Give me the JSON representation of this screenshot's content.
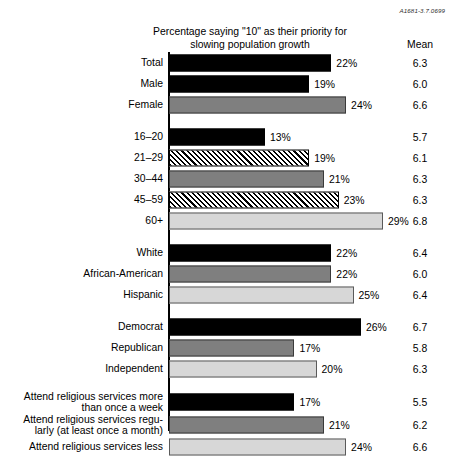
{
  "refcode": "A1681-3.7.0699",
  "title": {
    "line1": "Percentage saying \"10\" as their priority for",
    "line2": "slowing population growth"
  },
  "mean_header": "Mean",
  "chart_data": {
    "type": "bar",
    "orientation": "horizontal",
    "title": "Percentage saying \"10\" as their priority for slowing population growth",
    "xlabel": "",
    "ylabel": "",
    "xlim": [
      0,
      30
    ],
    "grid": false,
    "legend": false,
    "value_suffix": "%",
    "extra_column": {
      "header": "Mean",
      "values": [
        6.3,
        6.0,
        6.6,
        5.7,
        6.1,
        6.3,
        6.3,
        6.8,
        6.4,
        6.0,
        6.4,
        6.7,
        5.8,
        6.3,
        5.5,
        6.2,
        6.6
      ]
    },
    "categories": [
      "Total",
      "Male",
      "Female",
      "16–20",
      "21–29",
      "30–44",
      "45–59",
      "60+",
      "White",
      "African-American",
      "Hispanic",
      "Democrat",
      "Republican",
      "Independent",
      "Attend religious services more than once a week",
      "Attend religious services regularly (at least once a month)",
      "Attend religious services less"
    ],
    "values": [
      22,
      19,
      24,
      13,
      19,
      21,
      23,
      29,
      22,
      22,
      25,
      26,
      17,
      20,
      17,
      21,
      24
    ],
    "fills": [
      "black",
      "black",
      "gray",
      "black",
      "hatch",
      "gray",
      "hatch",
      "light",
      "black",
      "gray",
      "light",
      "black",
      "gray",
      "light",
      "black",
      "gray",
      "light"
    ],
    "colors": {
      "black": "#000000",
      "gray": "#7f7f7f",
      "light": "#d7d7d7",
      "hatch": "#000000"
    }
  },
  "groups": [
    {
      "name": "overall-and-gender",
      "rows": [
        {
          "label": "Total",
          "value": 22,
          "value_text": "22%",
          "mean": "6.3",
          "fill": "black"
        },
        {
          "label": "Male",
          "value": 19,
          "value_text": "19%",
          "mean": "6.0",
          "fill": "black"
        },
        {
          "label": "Female",
          "value": 24,
          "value_text": "24%",
          "mean": "6.6",
          "fill": "gray"
        }
      ]
    },
    {
      "name": "age",
      "rows": [
        {
          "label": "16–20",
          "value": 13,
          "value_text": "13%",
          "mean": "5.7",
          "fill": "black"
        },
        {
          "label": "21–29",
          "value": 19,
          "value_text": "19%",
          "mean": "6.1",
          "fill": "hatch"
        },
        {
          "label": "30–44",
          "value": 21,
          "value_text": "21%",
          "mean": "6.3",
          "fill": "gray"
        },
        {
          "label": "45–59",
          "value": 23,
          "value_text": "23%",
          "mean": "6.3",
          "fill": "hatch"
        },
        {
          "label": "60+",
          "value": 29,
          "value_text": "29%",
          "mean": "6.8",
          "fill": "light"
        }
      ]
    },
    {
      "name": "race-ethnicity",
      "rows": [
        {
          "label": "White",
          "value": 22,
          "value_text": "22%",
          "mean": "6.4",
          "fill": "black"
        },
        {
          "label": "African-American",
          "value": 22,
          "value_text": "22%",
          "mean": "6.0",
          "fill": "gray"
        },
        {
          "label": "Hispanic",
          "value": 25,
          "value_text": "25%",
          "mean": "6.4",
          "fill": "light"
        }
      ]
    },
    {
      "name": "party",
      "rows": [
        {
          "label": "Democrat",
          "value": 26,
          "value_text": "26%",
          "mean": "6.7",
          "fill": "black"
        },
        {
          "label": "Republican",
          "value": 17,
          "value_text": "17%",
          "mean": "5.8",
          "fill": "gray"
        },
        {
          "label": "Independent",
          "value": 20,
          "value_text": "20%",
          "mean": "6.3",
          "fill": "light"
        }
      ]
    },
    {
      "name": "religious-attendance",
      "rows": [
        {
          "label": "Attend religious services more\nthan once a week",
          "value": 17,
          "value_text": "17%",
          "mean": "5.5",
          "fill": "black"
        },
        {
          "label": "Attend religious services regu-\nlarly (at least once a month)",
          "value": 21,
          "value_text": "21%",
          "mean": "6.2",
          "fill": "gray"
        },
        {
          "label": "Attend religious services less",
          "value": 24,
          "value_text": "24%",
          "mean": "6.6",
          "fill": "light"
        }
      ]
    }
  ]
}
